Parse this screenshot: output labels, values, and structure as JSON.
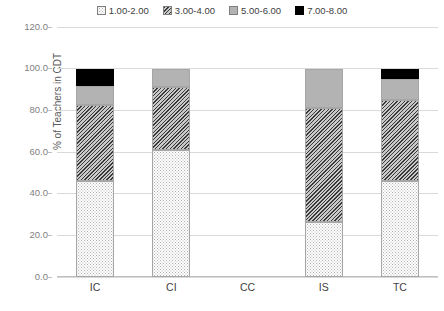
{
  "chart_data": {
    "type": "bar",
    "subtype": "stacked-100-percent",
    "title": "",
    "xlabel": "",
    "ylabel": "% of Teachers in CDT",
    "ylim": [
      0,
      120
    ],
    "yticks": [
      "0.0",
      "20.0",
      "40.0",
      "60.0",
      "80.0",
      "100.0",
      "120.0"
    ],
    "ytick_values": [
      0,
      20,
      40,
      60,
      80,
      100,
      120
    ],
    "grid": true,
    "legend_position": "top-center",
    "categories": [
      "IC",
      "CI",
      "CC",
      "IS",
      "TC"
    ],
    "series": [
      {
        "name": "1.00-2.00",
        "pattern": "dots",
        "values": [
          46.0,
          61.0,
          0,
          26.5,
          46.0
        ]
      },
      {
        "name": "3.00-4.00",
        "pattern": "hatch",
        "values": [
          36.8,
          30.0,
          0,
          54.5,
          39.0
        ]
      },
      {
        "name": "5.00-6.00",
        "pattern": "solidgray",
        "values": [
          8.8,
          9.0,
          0,
          19.0,
          10.0
        ]
      },
      {
        "name": "7.00-8.00",
        "pattern": "black",
        "values": [
          8.4,
          0.0,
          0,
          0.0,
          5.0
        ]
      }
    ]
  },
  "legend": {
    "items": [
      {
        "label": "1.00-2.00",
        "pattern": "dots"
      },
      {
        "label": "3.00-4.00",
        "pattern": "hatch"
      },
      {
        "label": "5.00-6.00",
        "pattern": "solidgray"
      },
      {
        "label": "7.00-8.00",
        "pattern": "black"
      }
    ]
  },
  "axes": {
    "y_title": "% of Teachers in CDT",
    "y_ticks": [
      "120.0",
      "100.0",
      "80.0",
      "60.0",
      "40.0",
      "20.0",
      "0.0"
    ],
    "x_ticks": [
      "IC",
      "CI",
      "CC",
      "IS",
      "TC"
    ]
  },
  "colors": {
    "gridline": "#d9d9d9",
    "axis": "#bfbfbf",
    "tick_text": "#7f7f7f",
    "label_text": "#404040",
    "series_black": "#000000",
    "series_gray": "#b3b3b3",
    "series_hatch": "#3a3a3a",
    "series_dots": "#b0b0b0"
  }
}
